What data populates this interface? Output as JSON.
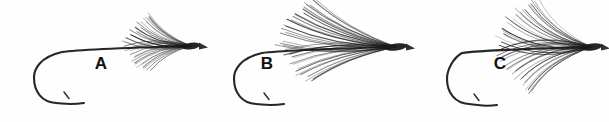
{
  "figure": {
    "background_color": "#fefefe",
    "ink_color": "#1a1a1a",
    "width": 609,
    "height": 122,
    "label_color": "#111111"
  },
  "flies": [
    {
      "id": "fly-a",
      "label": "A",
      "label_x": 101,
      "label_y": 69,
      "head_x": 191,
      "head_y": 46,
      "hook": {
        "eye_x": 186,
        "eye_y": 46,
        "shank_mid_x": 120,
        "shank_mid_y": 49,
        "shank_start_x": 62,
        "shank_start_y": 51,
        "bend_left_x": 34,
        "bend_low_y": 96,
        "point_tip_x": 84,
        "point_tip_y": 104,
        "barb_x": 64,
        "barb_y": 92
      },
      "hackle": {
        "fiber_count": 34,
        "angle_min_deg": 150,
        "angle_max_deg": 218,
        "length_min": 42,
        "length_max": 66,
        "curve": 0.16,
        "opacity_min": 0.3,
        "opacity_max": 0.88
      },
      "head": {
        "rx": 9,
        "ry": 3.4,
        "rotate_deg": -8
      }
    },
    {
      "id": "fly-b",
      "label": "B",
      "label_x": 267,
      "label_y": 69,
      "head_x": 396,
      "head_y": 47,
      "hook": {
        "eye_x": 391,
        "eye_y": 47,
        "shank_mid_x": 320,
        "shank_mid_y": 50,
        "shank_start_x": 262,
        "shank_start_y": 52,
        "bend_left_x": 234,
        "bend_low_y": 97,
        "point_tip_x": 284,
        "point_tip_y": 105,
        "barb_x": 264,
        "barb_y": 93
      },
      "hackle": {
        "fiber_count": 38,
        "angle_min_deg": 157,
        "angle_max_deg": 210,
        "length_min": 78,
        "length_max": 118,
        "curve": 0.1,
        "opacity_min": 0.22,
        "opacity_max": 0.92
      },
      "head": {
        "rx": 11,
        "ry": 3.6,
        "rotate_deg": -7
      }
    },
    {
      "id": "fly-c",
      "label": "C",
      "label_x": 500,
      "label_y": 69,
      "head_x": 592,
      "head_y": 47,
      "hook": {
        "eye_x": 587,
        "eye_y": 47,
        "shank_mid_x": 520,
        "shank_mid_y": 50,
        "shank_start_x": 462,
        "shank_start_y": 52,
        "bend_left_x": 447,
        "bend_low_y": 97,
        "point_tip_x": 497,
        "point_tip_y": 106,
        "barb_x": 474,
        "barb_y": 94
      },
      "hackle": {
        "fiber_count": 42,
        "angle_min_deg": 143,
        "angle_max_deg": 222,
        "length_min": 62,
        "length_max": 96,
        "curve": 0.18,
        "opacity_min": 0.24,
        "opacity_max": 0.92
      },
      "head": {
        "rx": 10,
        "ry": 3.6,
        "rotate_deg": -8
      }
    }
  ]
}
